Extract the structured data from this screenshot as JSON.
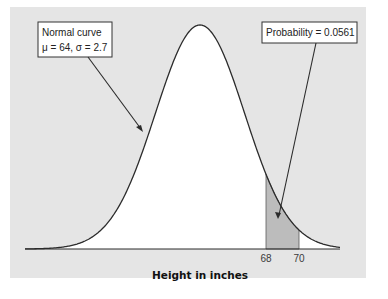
{
  "chart_data": {
    "type": "area",
    "title": "",
    "xlabel": "Height in inches",
    "ylabel": "",
    "distribution": {
      "name": "Normal",
      "mean": 64,
      "sd": 2.7
    },
    "shaded_interval": {
      "from": 68,
      "to": 70,
      "probability": 0.0561
    },
    "x_ticks": [
      68,
      70
    ],
    "x_tick_labels": [
      "68",
      "70"
    ],
    "xlim": [
      54.9,
      73.1
    ],
    "grid": false,
    "legend": null,
    "annotations": [
      {
        "id": "curve",
        "lines": [
          "Normal curve",
          "μ = 64, σ = 2.7"
        ],
        "points_to": "normal curve (left flank)"
      },
      {
        "id": "prob",
        "lines": [
          "Probability = 0.0561"
        ],
        "points_to": "shaded area between 68 and 70"
      }
    ]
  },
  "labels": {
    "xlabel": "Height in inches",
    "tick_68": "68",
    "tick_70": "70",
    "curve_line1": "Normal curve",
    "curve_line2": "μ = 64, σ = 2.7",
    "prob_label": "Probability = 0.0561"
  },
  "colors": {
    "panel": "#e5e5e5",
    "curve_area": "#ffffff",
    "shade": "#bcbcbc",
    "line": "#2b2b2b"
  }
}
